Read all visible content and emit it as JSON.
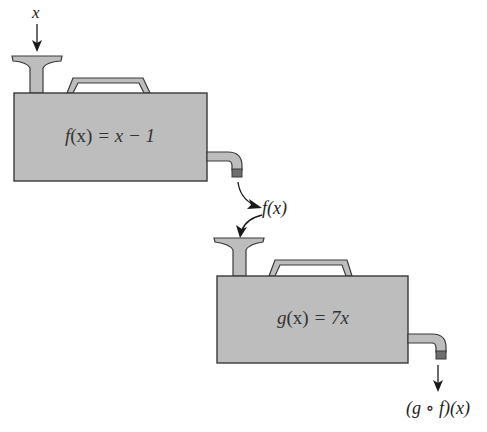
{
  "diagram": {
    "colors": {
      "machine_fill": "#bdbdbd",
      "outline": "#3a3a3a",
      "spout_tip": "#6e6e6e",
      "text": "#222222",
      "background": "#ffffff"
    },
    "input_label": "x",
    "machine1": {
      "label": "f(x) = x − 1",
      "label_parts": {
        "fname": "f",
        "arg": "(x)",
        "rest": " = x − 1"
      }
    },
    "intermediate_label": "f(x)",
    "machine2": {
      "label": "g(x) = 7x",
      "label_parts": {
        "fname": "g",
        "arg": "(x)",
        "rest": " = 7x"
      }
    },
    "output_label": "(g ∘ f)(x)"
  }
}
